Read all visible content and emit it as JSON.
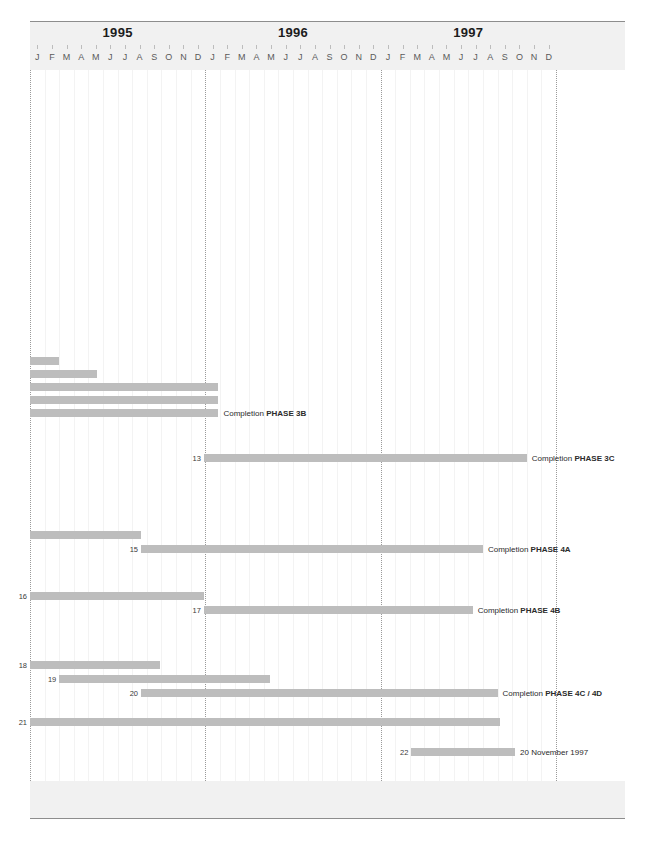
{
  "timeline": {
    "axis_left_px": 30,
    "axis_right_px": 556,
    "month_width_px": 14.61,
    "years": [
      {
        "label": "1995",
        "start_month_index": 0
      },
      {
        "label": "1996",
        "start_month_index": 12
      },
      {
        "label": "1997",
        "start_month_index": 24
      }
    ],
    "months": [
      "J",
      "F",
      "M",
      "A",
      "M",
      "J",
      "J",
      "A",
      "S",
      "O",
      "N",
      "D"
    ],
    "total_months": 36
  },
  "chart_data": {
    "type": "bar",
    "title": "",
    "subtitle": "",
    "xlabel": "",
    "ylabel": "",
    "grid": true,
    "legend": "none",
    "orientation": "horizontal-gantt",
    "x_axis": {
      "kind": "time",
      "range": [
        "1995-01",
        "1997-12"
      ],
      "year_ticks": [
        "1995",
        "1996",
        "1997"
      ],
      "month_ticks": [
        "J",
        "F",
        "M",
        "A",
        "M",
        "J",
        "J",
        "A",
        "S",
        "O",
        "N",
        "D",
        "J",
        "F",
        "M",
        "A",
        "M",
        "J",
        "J",
        "A",
        "S",
        "O",
        "N",
        "D",
        "J",
        "F",
        "M",
        "A",
        "M",
        "J",
        "J",
        "A",
        "S",
        "O",
        "N",
        "D"
      ]
    },
    "bar_color": "#bdbdbd",
    "tasks": [
      {
        "id": "",
        "row": 0,
        "start_month": 0.0,
        "end_month": 2.0,
        "y_px": 357,
        "label": "",
        "label_bold": ""
      },
      {
        "id": "",
        "row": 1,
        "start_month": 0.0,
        "end_month": 4.6,
        "y_px": 370,
        "label": "",
        "label_bold": ""
      },
      {
        "id": "",
        "row": 2,
        "start_month": 0.0,
        "end_month": 12.9,
        "y_px": 383,
        "label": "",
        "label_bold": ""
      },
      {
        "id": "",
        "row": 3,
        "start_month": 0.0,
        "end_month": 12.9,
        "y_px": 396,
        "label": "",
        "label_bold": ""
      },
      {
        "id": "",
        "row": 4,
        "start_month": 0.0,
        "end_month": 12.9,
        "y_px": 409,
        "label": "Completion ",
        "label_bold": "PHASE 3B"
      },
      {
        "id": "13",
        "row": 5,
        "start_month": 11.9,
        "end_month": 34.0,
        "y_px": 454,
        "label": "Completion ",
        "label_bold": "PHASE 3C"
      },
      {
        "id": "",
        "row": 6,
        "start_month": 0.0,
        "end_month": 7.6,
        "y_px": 531,
        "label": "",
        "label_bold": ""
      },
      {
        "id": "15",
        "row": 7,
        "start_month": 7.6,
        "end_month": 31.0,
        "y_px": 545,
        "label": "Completion ",
        "label_bold": "PHASE 4A"
      },
      {
        "id": "16",
        "row": 8,
        "start_month": 0.0,
        "end_month": 11.9,
        "y_px": 592,
        "label": "",
        "label_bold": ""
      },
      {
        "id": "17",
        "row": 9,
        "start_month": 11.9,
        "end_month": 30.3,
        "y_px": 606,
        "label": "Completion ",
        "label_bold": "PHASE 4B"
      },
      {
        "id": "18",
        "row": 10,
        "start_month": 0.0,
        "end_month": 8.9,
        "y_px": 661,
        "label": "",
        "label_bold": ""
      },
      {
        "id": "19",
        "row": 11,
        "start_month": 2.0,
        "end_month": 16.4,
        "y_px": 675,
        "label": "",
        "label_bold": ""
      },
      {
        "id": "20",
        "row": 12,
        "start_month": 7.6,
        "end_month": 32.0,
        "y_px": 689,
        "label": "Completion ",
        "label_bold": "PHASE 4C / 4D"
      },
      {
        "id": "21",
        "row": 13,
        "start_month": 0.0,
        "end_month": 32.2,
        "y_px": 718,
        "label": "",
        "label_bold": ""
      },
      {
        "id": "22",
        "row": 14,
        "start_month": 26.1,
        "end_month": 33.2,
        "y_px": 748,
        "label": "20 November 1997",
        "label_bold": ""
      }
    ]
  }
}
